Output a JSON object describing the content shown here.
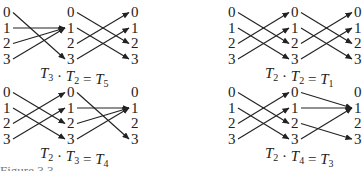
{
  "diagram": {
    "panels": [
      {
        "id": "top-left",
        "first_map_name": "T3",
        "second_map_name": "T2",
        "first_map": [
          3,
          1,
          1,
          1
        ],
        "second_map": [
          2,
          3,
          0,
          1
        ],
        "equation": {
          "left": "T",
          "left_sub": "3",
          "dot": "·",
          "mid": "T",
          "mid_sub": "2",
          "eq": "=",
          "right": "T",
          "right_sub": "5"
        }
      },
      {
        "id": "top-right",
        "first_map_name": "T2",
        "second_map_name": "T2",
        "first_map": [
          2,
          3,
          0,
          1
        ],
        "second_map": [
          2,
          3,
          0,
          1
        ],
        "equation": {
          "left": "T",
          "left_sub": "2",
          "dot": "·",
          "mid": "T",
          "mid_sub": "2",
          "eq": "=",
          "right": "T",
          "right_sub": "1"
        }
      },
      {
        "id": "bottom-left",
        "first_map_name": "T2",
        "second_map_name": "T3",
        "first_map": [
          2,
          3,
          0,
          1
        ],
        "second_map": [
          3,
          1,
          1,
          1
        ],
        "equation": {
          "left": "T",
          "left_sub": "2",
          "dot": "·",
          "mid": "T",
          "mid_sub": "3",
          "eq": "=",
          "right": "T",
          "right_sub": "4"
        }
      },
      {
        "id": "bottom-right",
        "first_map_name": "T2",
        "second_map_name": "T4",
        "first_map": [
          2,
          3,
          0,
          1
        ],
        "second_map": [
          1,
          1,
          3,
          1
        ],
        "equation": {
          "left": "T",
          "left_sub": "2",
          "dot": "·",
          "mid": "T",
          "mid_sub": "4",
          "eq": "=",
          "right": "T",
          "right_sub": "3"
        }
      }
    ],
    "node_labels": [
      "0",
      "1",
      "2",
      "3"
    ],
    "caption_fragment": "Figure 3.3"
  }
}
